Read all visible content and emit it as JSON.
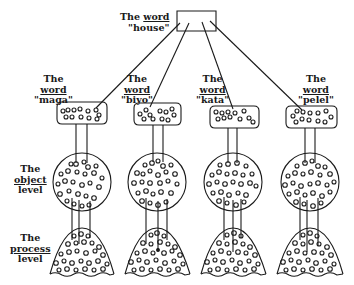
{
  "root": {
    "label_line1_prefix": "The",
    "label_line1_word": "word",
    "label_line2": "\"house\""
  },
  "words": [
    {
      "the": "The",
      "word": "word",
      "name": "\"maga\""
    },
    {
      "the": "The",
      "word": "word",
      "name": "\"biyo\""
    },
    {
      "the": "The",
      "word": "word",
      "name": "\"kata\""
    },
    {
      "the": "The",
      "word": "word",
      "name": "\"pelel\""
    }
  ],
  "levels": {
    "object": {
      "the": "The",
      "name": "object",
      "suffix": "level"
    },
    "process": {
      "the": "The",
      "name": "process",
      "suffix": "level"
    }
  },
  "colors": {
    "ink": "#1a1a1a",
    "background": "#ffffff"
  }
}
